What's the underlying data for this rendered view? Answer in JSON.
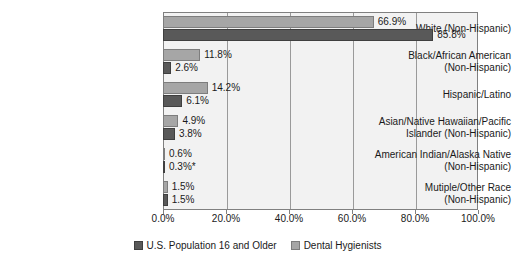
{
  "chart_data": {
    "type": "bar",
    "orientation": "horizontal",
    "title": "",
    "xlabel": "",
    "ylabel": "",
    "xlim": [
      0,
      100
    ],
    "grid": true,
    "legend_position": "bottom",
    "xticks": [
      "0.0%",
      "20.0%",
      "40.0%",
      "60.0%",
      "80.0%",
      "100.0%"
    ],
    "xtick_values": [
      0,
      20,
      40,
      60,
      80,
      100
    ],
    "categories": [
      {
        "lines": [
          "White (Non-Hispanic)"
        ]
      },
      {
        "lines": [
          "Black/African American",
          "(Non-Hispanic)"
        ]
      },
      {
        "lines": [
          "Hispanic/Latino"
        ]
      },
      {
        "lines": [
          "Asian/Native Hawaiian/Pacific",
          "Islander (Non-Hispanic)"
        ]
      },
      {
        "lines": [
          "American Indian/Alaska Native",
          "(Non-Hispanic)"
        ]
      },
      {
        "lines": [
          "Mutiple/Other Race",
          "(Non-Hispanic)"
        ]
      }
    ],
    "series": [
      {
        "name": "Dental Hygienists",
        "color": "#a6a6a6",
        "values": [
          66.9,
          11.8,
          14.2,
          4.9,
          0.6,
          1.5
        ],
        "labels": [
          "66.9%",
          "11.8%",
          "14.2%",
          "4.9%",
          "0.6%",
          "1.5%"
        ]
      },
      {
        "name": "U.S. Population 16 and Older",
        "color": "#595959",
        "values": [
          85.8,
          2.6,
          6.1,
          3.8,
          0.3,
          1.5
        ],
        "labels": [
          "85.8%",
          "2.6%",
          "6.1%",
          "3.8%",
          "0.3%*",
          "1.5%"
        ]
      }
    ],
    "legend": [
      {
        "label": "U.S. Population 16 and Older",
        "swatch": "dark"
      },
      {
        "label": "Dental Hygienists",
        "swatch": "light"
      }
    ]
  }
}
